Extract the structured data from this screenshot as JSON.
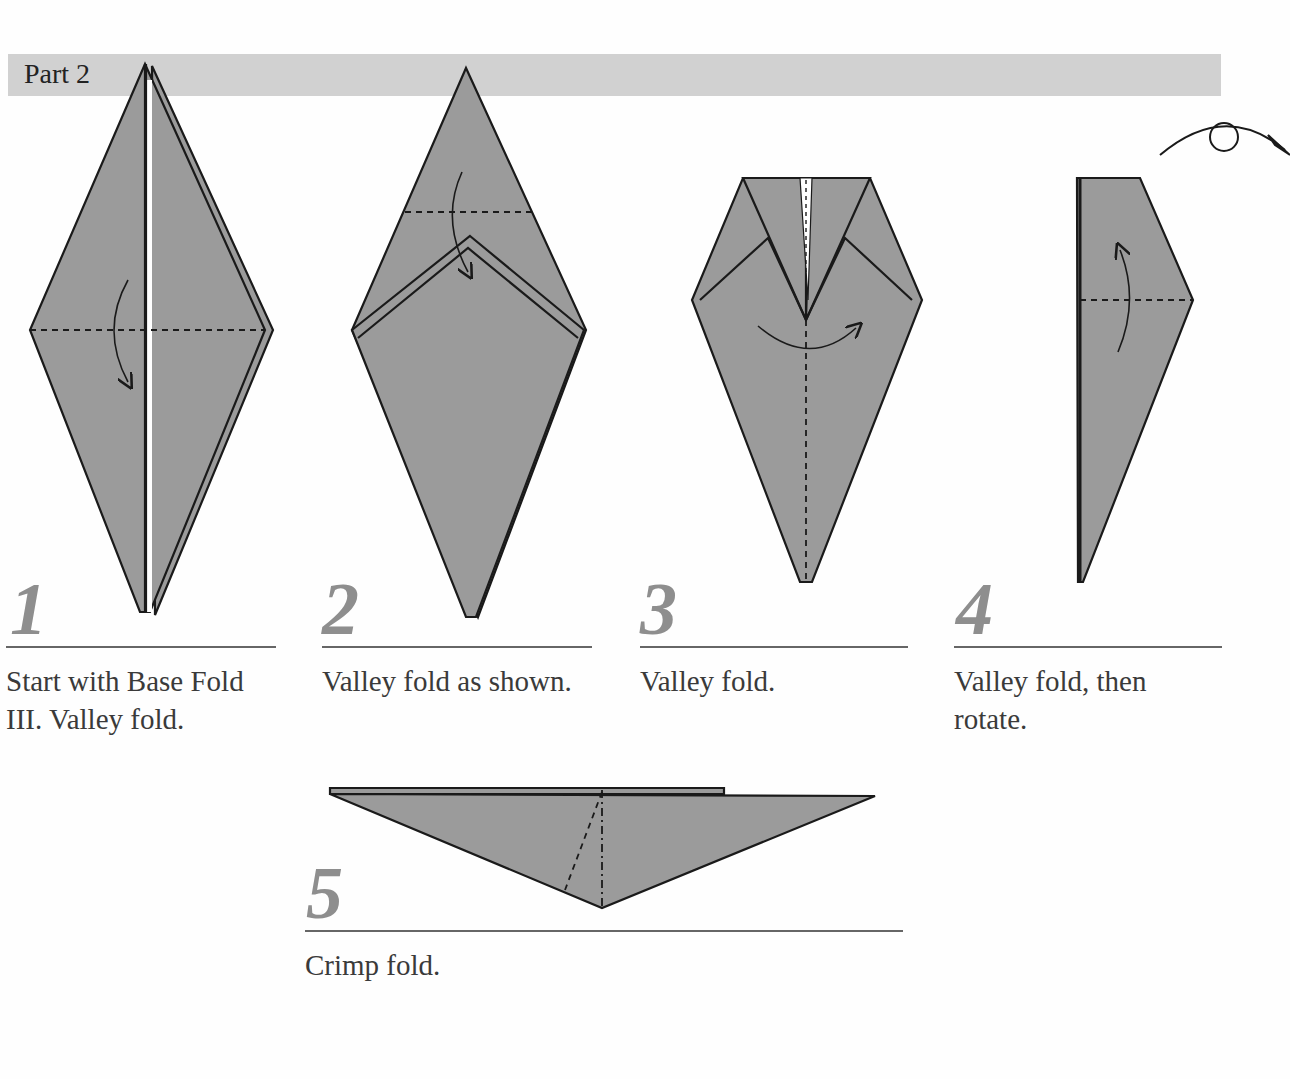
{
  "header": {
    "part_label": "Part 2"
  },
  "colors": {
    "paper": "#9b9b9b",
    "bar": "#d1d1d1",
    "step_number": "#8e8e8e",
    "line": "#1a1a1a"
  },
  "steps": [
    {
      "number": "1",
      "caption_line1": "Start with Base Fold",
      "caption_line2": "III. Valley fold."
    },
    {
      "number": "2",
      "caption_line1": "Valley fold as shown.",
      "caption_line2": ""
    },
    {
      "number": "3",
      "caption_line1": "Valley fold.",
      "caption_line2": ""
    },
    {
      "number": "4",
      "caption_line1": "Valley fold, then",
      "caption_line2": "rotate."
    },
    {
      "number": "5",
      "caption_line1": "Crimp fold.",
      "caption_line2": ""
    }
  ],
  "icons": [
    "valley-fold-arrow-icon",
    "rotate-arrow-icon",
    "fold-line-dashed-icon"
  ]
}
